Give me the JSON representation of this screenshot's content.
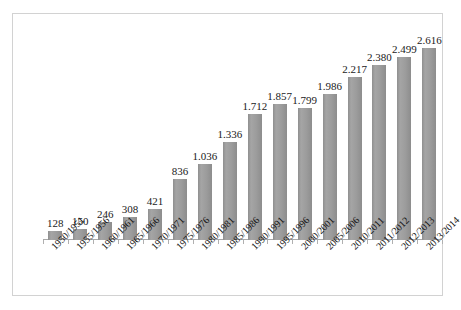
{
  "chart_data": {
    "type": "bar",
    "title": "",
    "subtitle": "",
    "xlabel": "",
    "ylabel": "",
    "grid": false,
    "legend": "none",
    "y_axis_labels_shown": false,
    "value_label_format": "european-thousands-separator-dot",
    "ylim": [
      0,
      2.85
    ],
    "categories": [
      "1950/1951",
      "1955/1956",
      "1960/1961",
      "1965/1966",
      "1970/1971",
      "1975/1976",
      "1980/1981",
      "1985/1986",
      "1990/1991",
      "1995/1996",
      "2000/2001",
      "2005/2006",
      "2010/2011",
      "2011/2012",
      "2012/2013",
      "2013/2014"
    ],
    "values": [
      128,
      150,
      246,
      308,
      421,
      836,
      1036,
      1336,
      1712,
      1857,
      1799,
      1986,
      2217,
      2380,
      2499,
      2616
    ],
    "value_labels": [
      "128",
      "150",
      "246",
      "308",
      "421",
      "836",
      "1.036",
      "1.336",
      "1.712",
      "1.857",
      "1.799",
      "1.986",
      "2.217",
      "2.380",
      "2.499",
      "2.616"
    ],
    "series": [
      {
        "name": "",
        "values": [
          128,
          150,
          246,
          308,
          421,
          836,
          1036,
          1336,
          1712,
          1857,
          1799,
          1986,
          2217,
          2380,
          2499,
          2616
        ]
      }
    ],
    "colors": {
      "bar": "#9a9a9a",
      "axis": "#a8a8a8",
      "frame": "#d2d2d2",
      "text": "#1a1a1a",
      "background": "#ffffff"
    }
  }
}
